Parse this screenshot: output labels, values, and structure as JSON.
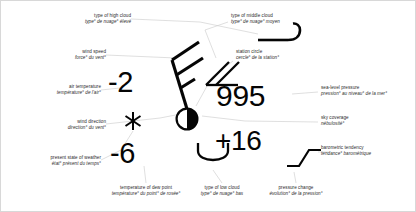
{
  "diagram": {
    "labels": [
      {
        "key": "high_cloud",
        "name": "label-type-of-high-cloud",
        "en": "type of high cloud",
        "fr": "type° de nuage° élevé"
      },
      {
        "key": "wind_speed",
        "name": "label-wind-speed",
        "en": "wind speed",
        "fr": "force° du vent°"
      },
      {
        "key": "air_temperature",
        "name": "label-air-temperature",
        "en": "air temperature",
        "fr": "température° de l'air°"
      },
      {
        "key": "wind_direction",
        "name": "label-wind-direction",
        "en": "wind direction",
        "fr": "direction° du vent°"
      },
      {
        "key": "present_weather",
        "name": "label-present-state-of-weather",
        "en": "present state of weather",
        "fr": "état° présent du temps°"
      },
      {
        "key": "dew_point",
        "name": "label-temperature-of-dew-point",
        "en": "temperature of dew point",
        "fr": "température° du point° de rosée°"
      },
      {
        "key": "low_cloud",
        "name": "label-type-of-low-cloud",
        "en": "type of low cloud",
        "fr": "type° de nuage° bas"
      },
      {
        "key": "pressure_change",
        "name": "label-pressure-change",
        "en": "pressure change",
        "fr": "évolution° de la pression°"
      },
      {
        "key": "middle_cloud",
        "name": "label-type-of-middle-cloud",
        "en": "type of middle cloud",
        "fr": "type° de nuage° moyen"
      },
      {
        "key": "station_circle",
        "name": "label-station-circle",
        "en": "station circle",
        "fr": "cercle° de la station°"
      },
      {
        "key": "sea_level_pressure",
        "name": "label-sea-level-pressure",
        "en": "sea-level pressure",
        "fr": "pression° au niveau° de la mer°"
      },
      {
        "key": "sky_coverage",
        "name": "label-sky-coverage",
        "en": "sky coverage",
        "fr": "nébulosité°"
      },
      {
        "key": "barometric_tendency",
        "name": "label-barometric-tendency",
        "en": "barometric tendency",
        "fr": "tendance° barométrique"
      }
    ],
    "values": {
      "air_temperature": "-2",
      "dew_point": "-6",
      "sea_level_pressure": "995",
      "pressure_change": "+16"
    },
    "symbols": {
      "present_weather": "snow-asterisk",
      "low_cloud": "cumulus-arc",
      "middle_cloud": "altostratus-triangle",
      "high_cloud": "cirrus-hook",
      "station_circle": "half-filled-circle",
      "wind_barb": "wind-barb-two-full-one-half",
      "barometric_tendency": "rising-then-steady-trace"
    },
    "colors": {
      "ink": "#050505",
      "label_text": "#2b2b2b",
      "leader_line": "#c9c9c9",
      "frame": "#d8d8d8"
    }
  }
}
